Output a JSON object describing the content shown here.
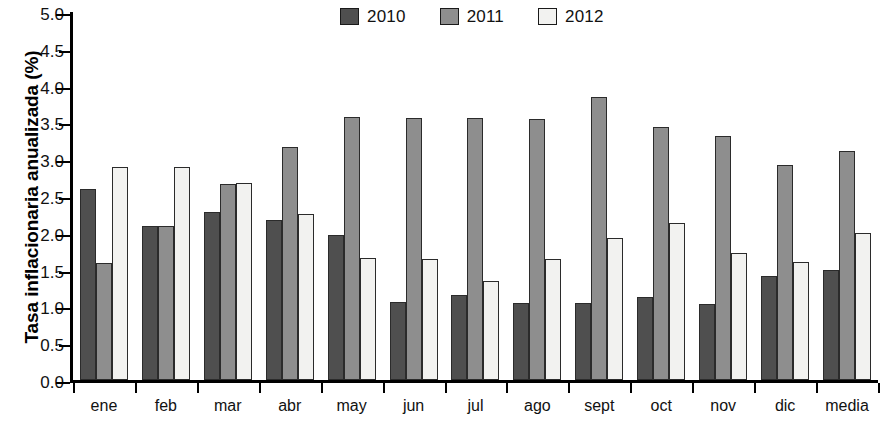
{
  "chart_data": {
    "type": "bar",
    "title": "",
    "subtitle": "",
    "xlabel": "",
    "ylabel": "Tasa inflacionaria anualizada (%)",
    "categories": [
      "ene",
      "feb",
      "mar",
      "abr",
      "may",
      "jun",
      "jul",
      "ago",
      "sept",
      "oct",
      "nov",
      "dic",
      "media"
    ],
    "series": [
      {
        "name": "2010",
        "color": "#4f4f4f",
        "values": [
          2.59,
          2.09,
          2.28,
          2.17,
          1.97,
          1.06,
          1.16,
          1.05,
          1.05,
          1.13,
          1.03,
          1.41,
          1.5
        ]
      },
      {
        "name": "2011",
        "color": "#8e8e8e",
        "values": [
          1.59,
          2.09,
          2.67,
          3.17,
          3.57,
          3.56,
          3.56,
          3.55,
          3.85,
          3.44,
          3.32,
          2.92,
          3.11
        ]
      },
      {
        "name": "2012",
        "color": "#f2f2f0",
        "values": [
          2.89,
          2.89,
          2.68,
          2.26,
          1.66,
          1.65,
          1.34,
          1.64,
          1.93,
          2.13,
          1.72,
          1.61,
          2.0
        ]
      }
    ],
    "ylim": [
      0.0,
      5.0
    ],
    "ytick_labels": [
      "0.0",
      "0.5",
      "1.0",
      "1.5",
      "2.0",
      "2.5",
      "3.0",
      "3.5",
      "4.0",
      "4.5",
      "5.0"
    ],
    "ytick_values": [
      0.0,
      0.5,
      1.0,
      1.5,
      2.0,
      2.5,
      3.0,
      3.5,
      4.0,
      4.5,
      5.0
    ],
    "grid": false,
    "legend_position": "top-center",
    "legend_entries": [
      "2010",
      "2011",
      "2012"
    ]
  },
  "legend": {
    "items": [
      {
        "label": "2010",
        "swatch": "#4f4f4f"
      },
      {
        "label": "2011",
        "swatch": "#8e8e8e"
      },
      {
        "label": "2012",
        "swatch": "#f2f2f0"
      }
    ]
  },
  "axes": {
    "y_title": "Tasa inflacionaria anualizada (%)"
  },
  "footer": {
    "cutoff_text": ""
  }
}
